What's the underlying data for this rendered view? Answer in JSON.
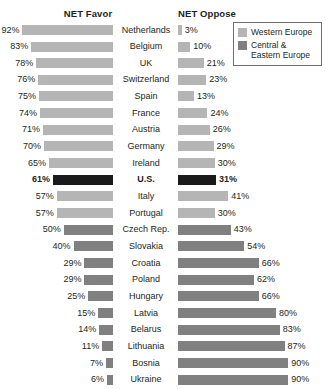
{
  "headers": {
    "favor": "NET Favor",
    "oppose": "NET Oppose"
  },
  "legend": {
    "items": [
      {
        "label": "Western Europe",
        "color": "#b5b5b5",
        "swatch_name": "legend-swatch-western-europe"
      },
      {
        "label": "Central &\nEastern Europe",
        "color": "#808080",
        "swatch_name": "legend-swatch-central-eastern-europe"
      }
    ]
  },
  "colors": {
    "western_europe": "#b5b5b5",
    "central_eastern_europe": "#808080",
    "highlight": "#1a1a1a",
    "text": "#231f20",
    "legend_border": "#6d6e71",
    "background": "#ffffff"
  },
  "chart_data": {
    "type": "bar",
    "title": "",
    "subtitle": "",
    "xlabel": "",
    "ylabel": "",
    "orientation": "horizontal",
    "layout": "diverging-paired",
    "grid": false,
    "legend_position": "top-right",
    "axis_range_percent": [
      0,
      100
    ],
    "categories": [
      "Netherlands",
      "Belgium",
      "UK",
      "Switzerland",
      "Spain",
      "France",
      "Austria",
      "Germany",
      "Ireland",
      "U.S.",
      "Italy",
      "Portugal",
      "Czech Rep.",
      "Slovakia",
      "Croatia",
      "Poland",
      "Hungary",
      "Latvia",
      "Belarus",
      "Lithuania",
      "Bosnia",
      "Ukraine"
    ],
    "series": [
      {
        "name": "NET Favor",
        "side": "left",
        "values": [
          92,
          83,
          78,
          76,
          75,
          74,
          71,
          70,
          65,
          61,
          57,
          57,
          50,
          40,
          29,
          29,
          25,
          15,
          14,
          11,
          7,
          6
        ],
        "labels": [
          "92%",
          "83%",
          "78%",
          "76%",
          "75%",
          "74%",
          "71%",
          "70%",
          "65%",
          "61%",
          "57%",
          "57%",
          "50%",
          "40%",
          "29%",
          "29%",
          "25%",
          "15%",
          "14%",
          "11%",
          "7%",
          "6%"
        ]
      },
      {
        "name": "NET Oppose",
        "side": "right",
        "values": [
          3,
          10,
          21,
          23,
          13,
          24,
          26,
          29,
          30,
          31,
          41,
          30,
          43,
          54,
          66,
          62,
          66,
          80,
          83,
          87,
          90,
          90
        ],
        "labels": [
          "3%",
          "10%",
          "21%",
          "23%",
          "13%",
          "24%",
          "26%",
          "29%",
          "30%",
          "31%",
          "41%",
          "30%",
          "43%",
          "54%",
          "66%",
          "62%",
          "66%",
          "80%",
          "83%",
          "87%",
          "90%",
          "90%"
        ]
      }
    ],
    "groups": [
      "western",
      "western",
      "western",
      "western",
      "western",
      "western",
      "western",
      "western",
      "western",
      "highlight",
      "western",
      "western",
      "central",
      "central",
      "central",
      "central",
      "central",
      "central",
      "central",
      "central",
      "central",
      "central"
    ]
  }
}
